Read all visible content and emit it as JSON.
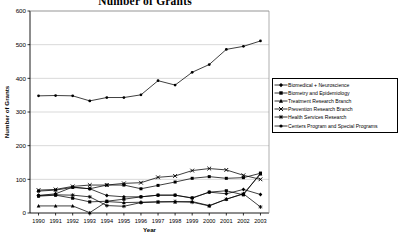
{
  "chart_data": {
    "type": "line",
    "title": "Number of Grants",
    "xlabel": "Year",
    "ylabel": "Number of Grants",
    "grid": true,
    "legend_position": "right",
    "ylim": [
      0,
      600
    ],
    "yticks": [
      0,
      100,
      200,
      300,
      400,
      500,
      600
    ],
    "ytick_labels": [
      "0",
      "100",
      "200",
      "300",
      "400",
      "500",
      "600"
    ],
    "categories": [
      "1990",
      "1991",
      "1992",
      "1993",
      "1994",
      "1995",
      "1996",
      "1997",
      "1998",
      "1999",
      "2000",
      "2001",
      "2002",
      "2003"
    ],
    "x": [
      "1990",
      "1991",
      "1992",
      "1993",
      "1994",
      "1995",
      "1996",
      "1997",
      "1998",
      "1999",
      "2000",
      "2001",
      "2002",
      "2003"
    ],
    "series": [
      {
        "name": "Biomedical + Neuroscience",
        "marker": "diamond",
        "color": "#000000",
        "values": [
          52,
          57,
          77,
          72,
          52,
          48,
          48,
          53,
          53,
          44,
          62,
          57,
          70,
          55
        ]
      },
      {
        "name": "Biometry and Epidemiology",
        "marker": "square",
        "color": "#000000",
        "values": [
          50,
          53,
          44,
          33,
          35,
          41,
          48,
          53,
          53,
          45,
          62,
          66,
          54,
          118
        ]
      },
      {
        "name": "Treatment Research Branch",
        "marker": "triangle",
        "color": "#000000",
        "values": [
          21,
          21,
          21,
          1,
          34,
          31,
          32,
          33,
          33,
          34,
          22,
          41,
          57,
          116
        ]
      },
      {
        "name": "Prevention Research Branch",
        "marker": "x",
        "color": "#000000",
        "values": [
          68,
          70,
          79,
          83,
          83,
          88,
          90,
          106,
          110,
          126,
          132,
          128,
          112,
          100
        ]
      },
      {
        "name": "Health Services Research",
        "marker": "star",
        "color": "#000000",
        "values": [
          52,
          54,
          53,
          48,
          22,
          20,
          31,
          33,
          34,
          32,
          21,
          41,
          57,
          18
        ]
      },
      {
        "name": "Centers Program and Special Programs",
        "marker": "circle",
        "color": "#000000",
        "values": [
          348,
          349,
          348,
          333,
          343,
          343,
          351,
          393,
          380,
          418,
          441,
          486,
          495,
          511
        ]
      }
    ],
    "lower_cluster_series": [
      {
        "name": "Biomedical + Neuroscience alt upper",
        "marker": "square-upper",
        "values": [
          65,
          68,
          76,
          72,
          83,
          83,
          72,
          82,
          92,
          103,
          108,
          103,
          105,
          118
        ]
      }
    ]
  }
}
